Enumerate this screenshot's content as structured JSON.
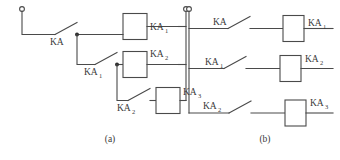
{
  "figure": {
    "panels": [
      {
        "id": "a",
        "caption": "(a)",
        "description": "cascaded-interlock-ladder",
        "switches": [
          {
            "id": "a-sw-ka",
            "base": "KA",
            "sub": ""
          },
          {
            "id": "a-sw-ka1",
            "base": "KA",
            "sub": "1"
          },
          {
            "id": "a-sw-ka2",
            "base": "KA",
            "sub": "2"
          }
        ],
        "coils": [
          {
            "id": "a-coil-ka1",
            "base": "KA",
            "sub": "1"
          },
          {
            "id": "a-coil-ka2",
            "base": "KA",
            "sub": "2"
          },
          {
            "id": "a-coil-ka3",
            "base": "KA",
            "sub": "3"
          }
        ],
        "terminals": [
          {
            "id": "a-terminal-left",
            "position": "top-left"
          },
          {
            "id": "a-terminal-right",
            "position": "top-right"
          }
        ],
        "junctions": [
          {
            "id": "a-junction-1"
          },
          {
            "id": "a-junction-2"
          }
        ]
      },
      {
        "id": "b",
        "caption": "(b)",
        "description": "parallel-branch-ladder",
        "switches": [
          {
            "id": "b-sw-ka",
            "base": "KA",
            "sub": ""
          },
          {
            "id": "b-sw-ka1",
            "base": "KA",
            "sub": "1"
          },
          {
            "id": "b-sw-ka2",
            "base": "KA",
            "sub": "2"
          }
        ],
        "coils": [
          {
            "id": "b-coil-ka1",
            "base": "KA",
            "sub": "1"
          },
          {
            "id": "b-coil-ka2",
            "base": "KA",
            "sub": "2"
          },
          {
            "id": "b-coil-ka3",
            "base": "KA",
            "sub": "3"
          }
        ],
        "terminals": [
          {
            "id": "b-terminal-left",
            "position": "top-left"
          }
        ],
        "junctions": []
      }
    ],
    "colors": {
      "line": "#4a4a4a",
      "junction": "#2e2e2e",
      "text": "#3a3a3a",
      "background": "#ffffff"
    }
  }
}
